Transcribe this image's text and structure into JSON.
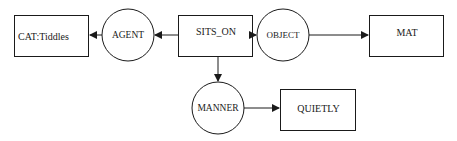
{
  "diagram": {
    "type": "conceptual-graph",
    "nodes": [
      {
        "id": "cat",
        "shape": "box",
        "label": "CAT:Tiddles"
      },
      {
        "id": "agent",
        "shape": "circle",
        "label": "AGENT"
      },
      {
        "id": "sits_on",
        "shape": "box",
        "label": "SITS_ON"
      },
      {
        "id": "object",
        "shape": "circle",
        "label": "OBJECT"
      },
      {
        "id": "mat",
        "shape": "box",
        "label": "MAT"
      },
      {
        "id": "manner",
        "shape": "circle",
        "label": "MANNER"
      },
      {
        "id": "quietly",
        "shape": "box",
        "label": "QUIETLY"
      }
    ],
    "edges": [
      {
        "from": "sits_on",
        "to": "agent"
      },
      {
        "from": "agent",
        "to": "cat"
      },
      {
        "from": "sits_on",
        "to": "object"
      },
      {
        "from": "object",
        "to": "mat"
      },
      {
        "from": "sits_on",
        "to": "manner"
      },
      {
        "from": "manner",
        "to": "quietly"
      }
    ],
    "colors": {
      "stroke": "#1a1a1a",
      "background": "#ffffff"
    }
  }
}
